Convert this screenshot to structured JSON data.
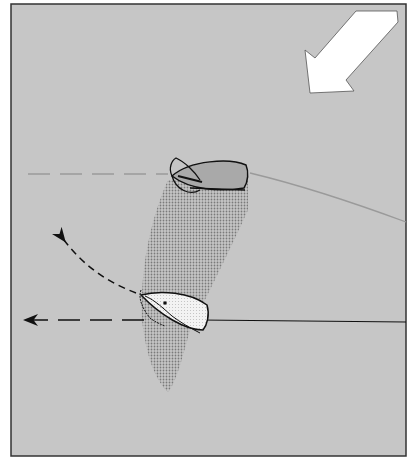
{
  "diagram": {
    "type": "sailing-maneuver-illustration",
    "colors": {
      "water": "#c6c6c6",
      "frame": "#333333",
      "wind_arrow_fill": "#ffffff",
      "boat_windward_fill": "#a9a9a9",
      "boat_leeward_fill": "#f2f2f2",
      "wind_shadow": "#8f8f8f",
      "track_line": "#111111",
      "faint_line": "#9a9a9a"
    },
    "elements": {
      "wind_arrow": {
        "direction": "from-top-right-to-bottom-left"
      },
      "windward_boat": {
        "position": "upper-center",
        "heading": "left"
      },
      "leeward_boat": {
        "position": "lower-center",
        "heading": "left-up",
        "sail": "luffing"
      },
      "wind_shadow": {
        "shape": "dotted-cone",
        "from": "windward_boat",
        "to": "bottom"
      },
      "paths": [
        {
          "name": "windward-track-dashed",
          "style": "dashed-faint"
        },
        {
          "name": "windward-wake",
          "style": "solid-faint"
        },
        {
          "name": "leeward-track-straight",
          "style": "dashed-arrow"
        },
        {
          "name": "leeward-escape-curve",
          "style": "dashed-arrow"
        },
        {
          "name": "leeward-wake",
          "style": "solid"
        }
      ]
    }
  }
}
